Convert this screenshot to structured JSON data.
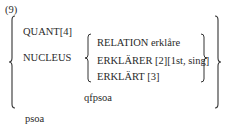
{
  "example": {
    "number": "(9)",
    "outer": {
      "row1": "QUANT[4]",
      "row2_label": "NUCLEUS",
      "inner": {
        "row1": "RELATION erklåre",
        "row2": "ERKLÄRER [2][1st, sing]",
        "row3": "ERKLÄRT [3]"
      },
      "inner_type": "qfpsoa"
    },
    "outer_type": "psoa"
  }
}
